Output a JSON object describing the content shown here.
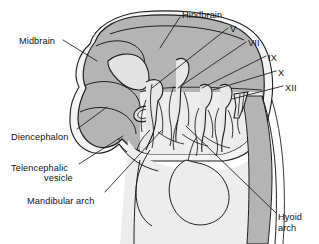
{
  "figure": {
    "kind": "anatomical-line-drawing",
    "background_color": "#ffffff",
    "line_color": "#1a1a1a",
    "fills": {
      "brain_gray": "#b4b4b4",
      "brain_gray_dark": "#a8a8a8",
      "ventricle_light": "#e2e2e2",
      "pharynx_light": "#ededed",
      "outer_rim": "#f2f2f2",
      "nerve_light": "#e8e8e8"
    }
  },
  "labels": {
    "midbrain": {
      "text": "Midbrain",
      "x": 19,
      "y": 36,
      "align": "left"
    },
    "hindbrain": {
      "text": "Hindbrain",
      "x": 182,
      "y": 10,
      "align": "left"
    },
    "diencephalon": {
      "text": "Diencephalon",
      "x": 11,
      "y": 132,
      "align": "left"
    },
    "telencephalic_vesicle_line1": {
      "text": "Telencephalic",
      "x": 11,
      "y": 163,
      "align": "left"
    },
    "telencephalic_vesicle_line2": {
      "text": "vesicle",
      "x": 44,
      "y": 173,
      "align": "left"
    },
    "mandibular_arch": {
      "text": "Mandibular arch",
      "x": 27,
      "y": 196,
      "align": "left"
    },
    "hyoid_arch_line1": {
      "text": "Hyoid",
      "x": 278,
      "y": 212,
      "align": "left"
    },
    "hyoid_arch_line2": {
      "text": "arch",
      "x": 278,
      "y": 223,
      "align": "left"
    }
  },
  "cranial_nerves": [
    {
      "numeral": "V",
      "x": 230,
      "y": 24
    },
    {
      "numeral": "VII",
      "x": 248,
      "y": 38
    },
    {
      "numeral": "IX",
      "x": 268,
      "y": 53
    },
    {
      "numeral": "X",
      "x": 278,
      "y": 68
    },
    {
      "numeral": "XII",
      "x": 285,
      "y": 83
    }
  ],
  "leader_lines": [
    {
      "name": "midbrain-leader",
      "x1": 63,
      "y1": 40,
      "x2": 97,
      "y2": 61
    },
    {
      "name": "hindbrain-leader",
      "x1": 180,
      "y1": 17,
      "x2": 160,
      "y2": 48
    },
    {
      "name": "cn-v-leader",
      "x1": 228,
      "y1": 28,
      "x2": 152,
      "y2": 88
    },
    {
      "name": "cn-vii-leader",
      "x1": 246,
      "y1": 42,
      "x2": 177,
      "y2": 88
    },
    {
      "name": "cn-ix-leader",
      "x1": 266,
      "y1": 56,
      "x2": 200,
      "y2": 88
    },
    {
      "name": "cn-x-leader",
      "x1": 276,
      "y1": 71,
      "x2": 212,
      "y2": 89
    },
    {
      "name": "cn-xii-leader",
      "x1": 283,
      "y1": 86,
      "x2": 230,
      "y2": 98
    },
    {
      "name": "diencephalon-leader",
      "x1": 77,
      "y1": 129,
      "x2": 105,
      "y2": 108
    },
    {
      "name": "telencephalic-vesicle-leader",
      "x1": 79,
      "y1": 164,
      "x2": 122,
      "y2": 137
    },
    {
      "name": "mandibular-arch-leader",
      "x1": 105,
      "y1": 192,
      "x2": 160,
      "y2": 132
    },
    {
      "name": "hyoid-arch-leader",
      "x1": 276,
      "y1": 213,
      "x2": 186,
      "y2": 126
    }
  ],
  "structures": [
    {
      "name": "midbrain-region",
      "description": "large shaded dome at upper left of the brain vesicle"
    },
    {
      "name": "hindbrain-region",
      "description": "shaded region across the top right of the brain"
    },
    {
      "name": "diencephalon-region",
      "description": "shaded lobe at the lower left of the brain"
    },
    {
      "name": "telencephalic-vesicle",
      "description": "rounded lobe at the bottom left of the brain"
    },
    {
      "name": "lateral-ventricle",
      "description": "light wedge-shaped cavity inside the midbrain region"
    },
    {
      "name": "otic-vesicle",
      "description": "small oval light structure below the midbrain"
    },
    {
      "name": "trigeminal-ganglion",
      "description": "ganglion of cranial nerve V"
    },
    {
      "name": "facial-ganglion",
      "description": "ganglion of cranial nerve VII"
    },
    {
      "name": "glossopharyngeal-ganglion",
      "description": "ganglion of cranial nerve IX"
    },
    {
      "name": "vagus-ganglion",
      "description": "ganglion of cranial nerve X"
    },
    {
      "name": "hypoglossal-rootlets",
      "description": "rootlets of cranial nerve XII"
    },
    {
      "name": "mandibular-arch",
      "description": "first pharyngeal arch, lower left"
    },
    {
      "name": "hyoid-arch",
      "description": "second pharyngeal arch, lower centre"
    },
    {
      "name": "spinal-cord-column",
      "description": "shaded vertical band along the right edge"
    }
  ]
}
